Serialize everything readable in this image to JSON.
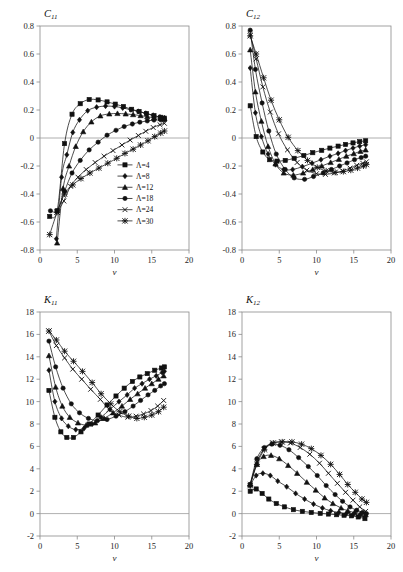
{
  "figure": {
    "layout": "2x2 grid of line charts",
    "panel_order": [
      "C11",
      "C12",
      "K11",
      "K12"
    ]
  },
  "legend": {
    "position": "inside panel C11, lower right",
    "entries": [
      {
        "label": "Λ=4",
        "marker": "square"
      },
      {
        "label": "Λ=8",
        "marker": "diamond"
      },
      {
        "label": "Λ=12",
        "marker": "triangle"
      },
      {
        "label": "Λ=18",
        "marker": "circle"
      },
      {
        "label": "Λ=24",
        "marker": "cross"
      },
      {
        "label": "Λ=30",
        "marker": "star"
      }
    ]
  },
  "chart_data": [
    {
      "id": "C11",
      "type": "line",
      "title": "C",
      "title_sub": "11",
      "xlabel": "v",
      "ylabel": "",
      "xlim": [
        0,
        20
      ],
      "ylim": [
        -0.8,
        0.8
      ],
      "xticks": [
        0,
        5,
        10,
        15,
        20
      ],
      "yticks": [
        -0.8,
        -0.6,
        -0.4,
        -0.2,
        0,
        0.2,
        0.4,
        0.6,
        0.8
      ],
      "grid": false,
      "zero_line": true,
      "series": [
        {
          "name": "Λ=4",
          "marker": "square",
          "x": [
            1.3,
            2.3,
            3.3,
            4.3,
            5.4,
            6.6,
            7.8,
            9.0,
            10.1,
            11.2,
            12.3,
            13.3,
            14.3,
            15.3,
            16.2,
            16.7
          ],
          "y": [
            -0.56,
            -0.52,
            -0.04,
            0.17,
            0.245,
            0.275,
            0.272,
            0.258,
            0.242,
            0.225,
            0.205,
            0.19,
            0.175,
            0.16,
            0.148,
            0.142
          ]
        },
        {
          "name": "Λ=8",
          "marker": "diamond",
          "x": [
            2.2,
            2.9,
            3.6,
            4.4,
            5.3,
            6.4,
            7.6,
            8.8,
            10.0,
            11.1,
            12.2,
            13.2,
            14.2,
            15.2,
            16.1,
            16.7
          ],
          "y": [
            -0.72,
            -0.28,
            -0.12,
            0.04,
            0.13,
            0.195,
            0.22,
            0.228,
            0.225,
            0.215,
            0.202,
            0.19,
            0.176,
            0.162,
            0.15,
            0.143
          ]
        },
        {
          "name": "Λ=12",
          "marker": "triangle",
          "x": [
            2.3,
            3.1,
            3.9,
            4.8,
            5.8,
            6.9,
            8.1,
            9.3,
            10.4,
            11.5,
            12.5,
            13.5,
            14.4,
            15.3,
            16.2,
            16.7
          ],
          "y": [
            -0.75,
            -0.36,
            -0.2,
            -0.06,
            0.045,
            0.115,
            0.158,
            0.172,
            0.175,
            0.172,
            0.167,
            0.16,
            0.152,
            0.145,
            0.14,
            0.137
          ]
        },
        {
          "name": "Λ=18",
          "marker": "circle",
          "x": [
            1.4,
            2.3,
            3.3,
            4.3,
            5.4,
            6.6,
            7.8,
            9.0,
            10.2,
            11.3,
            12.4,
            13.4,
            14.4,
            15.3,
            16.2,
            16.7
          ],
          "y": [
            -0.52,
            -0.52,
            -0.38,
            -0.25,
            -0.16,
            -0.085,
            -0.03,
            0.02,
            0.055,
            0.082,
            0.1,
            0.113,
            0.122,
            0.128,
            0.13,
            0.13
          ]
        },
        {
          "name": "Λ=24",
          "marker": "cross",
          "x": [
            2.3,
            3.2,
            4.1,
            5.1,
            6.2,
            7.4,
            8.6,
            9.8,
            11.0,
            12.1,
            13.2,
            14.2,
            15.2,
            16.1,
            16.7
          ],
          "y": [
            -0.53,
            -0.45,
            -0.345,
            -0.28,
            -0.225,
            -0.175,
            -0.13,
            -0.09,
            -0.05,
            -0.015,
            0.018,
            0.048,
            0.075,
            0.095,
            0.105
          ]
        },
        {
          "name": "Λ=30",
          "marker": "star",
          "x": [
            1.3,
            2.3,
            3.3,
            4.4,
            5.5,
            6.7,
            7.9,
            9.1,
            10.3,
            11.4,
            12.5,
            13.5,
            14.5,
            15.4,
            16.2,
            16.7
          ],
          "y": [
            -0.69,
            -0.53,
            -0.4,
            -0.335,
            -0.29,
            -0.25,
            -0.215,
            -0.18,
            -0.145,
            -0.11,
            -0.08,
            -0.05,
            -0.02,
            0.01,
            0.035,
            0.05
          ]
        }
      ]
    },
    {
      "id": "C12",
      "type": "line",
      "title": "C",
      "title_sub": "12",
      "xlabel": "v",
      "ylabel": "",
      "xlim": [
        0,
        20
      ],
      "ylim": [
        -0.8,
        0.8
      ],
      "xticks": [
        0,
        5,
        10,
        15,
        20
      ],
      "yticks": [
        -0.8,
        -0.6,
        -0.4,
        -0.2,
        0,
        0.2,
        0.4,
        0.6,
        0.8
      ],
      "grid": false,
      "zero_line": true,
      "series": [
        {
          "name": "Λ=4",
          "marker": "square",
          "x": [
            1.1,
            1.9,
            2.8,
            3.7,
            4.7,
            5.8,
            7.0,
            8.3,
            9.5,
            10.7,
            11.8,
            12.9,
            13.9,
            14.9,
            15.8,
            16.6
          ],
          "y": [
            0.23,
            0.01,
            -0.1,
            -0.155,
            -0.165,
            -0.16,
            -0.145,
            -0.125,
            -0.105,
            -0.088,
            -0.072,
            -0.058,
            -0.046,
            -0.035,
            -0.026,
            -0.02
          ]
        },
        {
          "name": "Λ=8",
          "marker": "diamond",
          "x": [
            1.1,
            1.8,
            2.6,
            3.5,
            4.5,
            5.6,
            6.8,
            8.1,
            9.4,
            10.6,
            11.8,
            12.9,
            13.9,
            14.9,
            15.8,
            16.6
          ],
          "y": [
            0.5,
            0.18,
            0.01,
            -0.115,
            -0.19,
            -0.225,
            -0.225,
            -0.205,
            -0.18,
            -0.155,
            -0.13,
            -0.11,
            -0.09,
            -0.072,
            -0.058,
            -0.048
          ]
        },
        {
          "name": "Λ=12",
          "marker": "triangle",
          "x": [
            1.1,
            1.8,
            2.6,
            3.5,
            4.5,
            5.6,
            6.9,
            8.2,
            9.5,
            10.7,
            11.9,
            13.0,
            14.0,
            15.0,
            15.9,
            16.6
          ],
          "y": [
            0.63,
            0.33,
            0.12,
            -0.06,
            -0.185,
            -0.25,
            -0.265,
            -0.25,
            -0.225,
            -0.2,
            -0.175,
            -0.152,
            -0.13,
            -0.112,
            -0.095,
            -0.085
          ]
        },
        {
          "name": "Λ=18",
          "marker": "circle",
          "x": [
            1.1,
            1.8,
            2.7,
            3.6,
            4.6,
            5.8,
            7.0,
            8.4,
            9.6,
            10.9,
            12.0,
            13.1,
            14.1,
            15.1,
            16.0,
            16.6
          ],
          "y": [
            0.77,
            0.49,
            0.25,
            0.05,
            -0.115,
            -0.225,
            -0.285,
            -0.295,
            -0.275,
            -0.25,
            -0.225,
            -0.2,
            -0.178,
            -0.155,
            -0.14,
            -0.13
          ]
        },
        {
          "name": "Λ=24",
          "marker": "cross",
          "x": [
            1.1,
            1.9,
            2.8,
            3.8,
            4.9,
            6.1,
            7.4,
            8.7,
            10.0,
            11.2,
            12.4,
            13.5,
            14.5,
            15.4,
            16.2,
            16.7
          ],
          "y": [
            0.74,
            0.565,
            0.365,
            0.185,
            0.03,
            -0.085,
            -0.175,
            -0.23,
            -0.255,
            -0.26,
            -0.25,
            -0.235,
            -0.215,
            -0.195,
            -0.18,
            -0.17
          ]
        },
        {
          "name": "Λ=30",
          "marker": "star",
          "x": [
            1.1,
            1.9,
            2.9,
            3.9,
            5.0,
            6.2,
            7.5,
            8.8,
            10.1,
            11.3,
            12.5,
            13.6,
            14.6,
            15.5,
            16.3,
            16.7
          ],
          "y": [
            0.73,
            0.6,
            0.43,
            0.27,
            0.13,
            0.005,
            -0.09,
            -0.16,
            -0.21,
            -0.235,
            -0.245,
            -0.24,
            -0.23,
            -0.215,
            -0.2,
            -0.19
          ]
        }
      ]
    },
    {
      "id": "K11",
      "type": "line",
      "title": "K",
      "title_sub": "11",
      "xlabel": "v",
      "ylabel": "",
      "xlim": [
        0,
        20
      ],
      "ylim": [
        -2,
        18
      ],
      "xticks": [
        0,
        5,
        10,
        15,
        20
      ],
      "yticks": [
        -2,
        0,
        2,
        4,
        6,
        8,
        10,
        12,
        14,
        16,
        18
      ],
      "grid": false,
      "zero_line": true,
      "series": [
        {
          "name": "Λ=4",
          "marker": "square",
          "x": [
            1.2,
            2.0,
            2.8,
            3.6,
            4.5,
            5.5,
            6.6,
            7.8,
            9.0,
            10.2,
            11.3,
            12.4,
            13.4,
            14.4,
            15.4,
            16.3,
            16.7
          ],
          "y": [
            11.0,
            8.6,
            7.3,
            6.8,
            6.8,
            7.3,
            8.0,
            8.8,
            9.7,
            10.5,
            11.2,
            11.8,
            12.2,
            12.5,
            12.8,
            13.0,
            13.1
          ]
        },
        {
          "name": "Λ=8",
          "marker": "diamond",
          "x": [
            1.2,
            2.0,
            2.9,
            3.8,
            4.8,
            5.9,
            7.0,
            8.2,
            9.4,
            10.6,
            11.7,
            12.7,
            13.7,
            14.7,
            15.6,
            16.4,
            16.7
          ],
          "y": [
            12.8,
            10.0,
            8.5,
            7.8,
            7.5,
            7.6,
            8.0,
            8.6,
            9.3,
            10.0,
            10.6,
            11.2,
            11.6,
            12.0,
            12.3,
            12.6,
            12.7
          ]
        },
        {
          "name": "Λ=12",
          "marker": "triangle",
          "x": [
            1.2,
            2.1,
            3.0,
            4.0,
            5.1,
            6.2,
            7.4,
            8.6,
            9.8,
            11.0,
            12.1,
            13.1,
            14.1,
            15.0,
            15.9,
            16.6
          ],
          "y": [
            14.1,
            11.3,
            9.6,
            8.6,
            8.1,
            7.9,
            8.1,
            8.5,
            9.0,
            9.6,
            10.2,
            10.7,
            11.2,
            11.6,
            12.0,
            12.3
          ]
        },
        {
          "name": "Λ=18",
          "marker": "circle",
          "x": [
            1.2,
            2.1,
            3.1,
            4.2,
            5.3,
            6.5,
            7.7,
            9.0,
            10.2,
            11.4,
            12.5,
            13.5,
            14.5,
            15.4,
            16.2,
            16.7
          ],
          "y": [
            15.4,
            13.1,
            11.2,
            9.8,
            9.0,
            8.5,
            8.3,
            8.4,
            8.7,
            9.1,
            9.6,
            10.1,
            10.6,
            11.0,
            11.4,
            11.6
          ]
        },
        {
          "name": "Λ=24",
          "marker": "cross",
          "x": [
            1.2,
            2.2,
            3.3,
            4.4,
            5.6,
            6.8,
            8.1,
            9.3,
            10.6,
            11.8,
            12.9,
            13.9,
            14.9,
            15.8,
            16.6
          ],
          "y": [
            16.3,
            15.0,
            13.9,
            12.9,
            12.0,
            11.1,
            10.2,
            9.3,
            8.8,
            8.6,
            8.7,
            8.9,
            9.2,
            9.6,
            10.1
          ]
        },
        {
          "name": "Λ=30",
          "marker": "star",
          "x": [
            1.2,
            2.2,
            3.3,
            4.5,
            5.7,
            7.0,
            8.2,
            9.5,
            10.7,
            11.9,
            13.0,
            14.0,
            15.0,
            15.9,
            16.6
          ],
          "y": [
            16.3,
            15.5,
            14.5,
            13.6,
            12.7,
            11.7,
            10.7,
            9.8,
            9.1,
            8.7,
            8.5,
            8.6,
            8.8,
            9.1,
            9.5
          ]
        }
      ]
    },
    {
      "id": "K12",
      "type": "line",
      "title": "K",
      "title_sub": "12",
      "xlabel": "v",
      "ylabel": "",
      "xlim": [
        0,
        20
      ],
      "ylim": [
        -2,
        18
      ],
      "xticks": [
        0,
        5,
        10,
        15,
        20
      ],
      "yticks": [
        -2,
        0,
        2,
        4,
        6,
        8,
        10,
        12,
        14,
        16,
        18
      ],
      "grid": false,
      "zero_line": true,
      "series": [
        {
          "name": "Λ=4",
          "marker": "square",
          "x": [
            1.1,
            1.9,
            2.7,
            3.6,
            4.6,
            5.7,
            6.9,
            8.1,
            9.3,
            10.5,
            11.6,
            12.7,
            13.7,
            14.7,
            15.6,
            16.5
          ],
          "y": [
            2.0,
            2.2,
            1.8,
            1.3,
            0.9,
            0.6,
            0.35,
            0.2,
            0.1,
            0.02,
            -0.04,
            -0.1,
            -0.15,
            -0.2,
            -0.3,
            -0.45
          ]
        },
        {
          "name": "Λ=8",
          "marker": "diamond",
          "x": [
            1.1,
            1.9,
            2.8,
            3.8,
            4.8,
            6.0,
            7.2,
            8.4,
            9.6,
            10.8,
            11.9,
            13.0,
            14.0,
            14.9,
            15.8,
            16.5
          ],
          "y": [
            2.5,
            3.4,
            3.6,
            3.4,
            2.9,
            2.4,
            1.8,
            1.3,
            0.85,
            0.5,
            0.25,
            0.1,
            0.0,
            -0.1,
            -0.2,
            -0.3
          ]
        },
        {
          "name": "Λ=12",
          "marker": "triangle",
          "x": [
            1.1,
            2.0,
            2.9,
            3.9,
            5.0,
            6.2,
            7.4,
            8.7,
            9.9,
            11.1,
            12.2,
            13.3,
            14.2,
            15.1,
            15.9,
            16.6
          ],
          "y": [
            2.6,
            4.4,
            5.1,
            5.2,
            4.9,
            4.3,
            3.6,
            2.8,
            2.1,
            1.4,
            0.9,
            0.5,
            0.25,
            0.1,
            0.0,
            -0.1
          ]
        },
        {
          "name": "Λ=18",
          "marker": "circle",
          "x": [
            1.1,
            2.0,
            3.0,
            4.0,
            5.1,
            6.3,
            7.6,
            8.9,
            10.1,
            11.3,
            12.5,
            13.5,
            14.5,
            15.4,
            16.2,
            16.7
          ],
          "y": [
            2.6,
            4.9,
            5.9,
            6.2,
            6.1,
            5.7,
            5.0,
            4.2,
            3.4,
            2.5,
            1.7,
            1.1,
            0.6,
            0.3,
            0.1,
            0.0
          ]
        },
        {
          "name": "Λ=24",
          "marker": "cross",
          "x": [
            1.1,
            2.0,
            3.0,
            4.1,
            5.3,
            6.5,
            7.8,
            9.1,
            10.4,
            11.6,
            12.8,
            13.9,
            14.9,
            15.8,
            16.6
          ],
          "y": [
            2.6,
            4.6,
            5.8,
            6.3,
            6.4,
            6.3,
            5.9,
            5.3,
            4.5,
            3.6,
            2.7,
            1.9,
            1.2,
            0.6,
            0.2
          ]
        },
        {
          "name": "Λ=30",
          "marker": "star",
          "x": [
            1.1,
            2.0,
            3.0,
            4.2,
            5.4,
            6.7,
            8.0,
            9.3,
            10.6,
            11.9,
            13.1,
            14.2,
            15.2,
            16.1,
            16.7
          ],
          "y": [
            2.5,
            4.4,
            5.7,
            6.3,
            6.4,
            6.4,
            6.2,
            5.8,
            5.2,
            4.4,
            3.5,
            2.6,
            1.9,
            1.3,
            1.0
          ]
        }
      ]
    }
  ]
}
